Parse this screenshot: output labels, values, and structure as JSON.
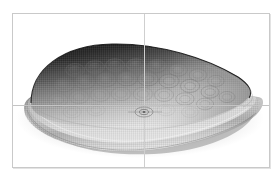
{
  "view": {
    "background_color": "#ffffff",
    "frame": {
      "border_color": "#c9c9c9",
      "x": 12,
      "y": 13,
      "width": 258,
      "height": 155
    },
    "guides": {
      "vertical_axis_x": 144,
      "horizontal_axis_y": 105,
      "color": "#c9c9c9"
    },
    "origin_marker": {
      "x": 144,
      "y": 112,
      "rx": 9,
      "ry": 5
    }
  },
  "model": {
    "name": "dimpled-ovoid-shell",
    "description": "Shaded grayscale 3D solid: teardrop / ovoid dome shell with dimpled honeycomb surface seated on a rounded flange base",
    "shading": "grayscale-gradient",
    "colors": {
      "highlight": "#f2f2f2",
      "midtone": "#b4b4b4",
      "shadow": "#4a4a4a",
      "deep_shadow": "#141414",
      "base_light": "#e6e6e6",
      "base_mid": "#bdbdbd",
      "base_dark": "#8e8e8e",
      "mesh_line": "#8a8a8a"
    },
    "dome": {
      "apex_x": 118,
      "apex_y": 45,
      "left_tip_x": 31,
      "right_tip_x": 250,
      "bottom_y": 128
    },
    "base": {
      "top_y": 100,
      "bottom_y": 151,
      "left_x": 24,
      "right_x": 258
    },
    "dimple_rows": [
      {
        "count": 8,
        "cy": 66,
        "rx": 9.5,
        "ry": 6.5
      },
      {
        "count": 9,
        "cy": 80,
        "rx": 10.5,
        "ry": 7.0
      },
      {
        "count": 8,
        "cy": 94,
        "rx": 10.0,
        "ry": 6.8
      },
      {
        "count": 5,
        "cy": 108,
        "rx": 9.0,
        "ry": 6.0
      }
    ]
  }
}
